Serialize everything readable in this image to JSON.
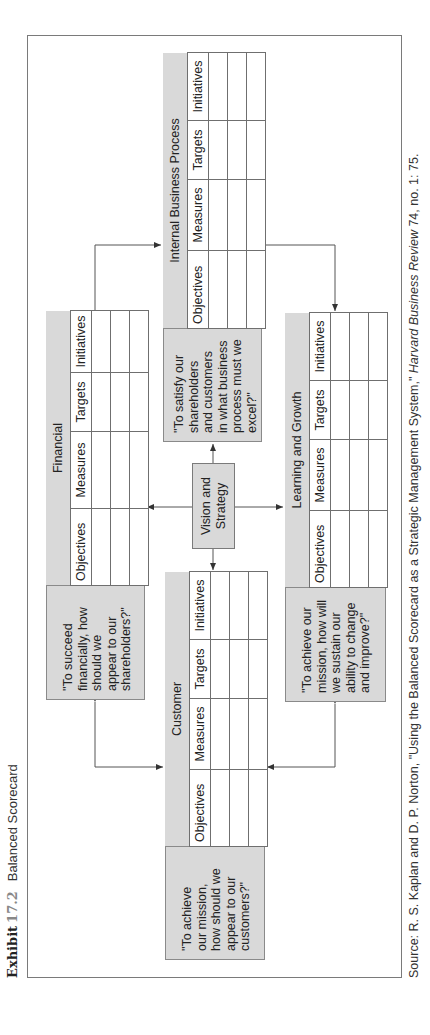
{
  "exhibit": {
    "label": "Exhibit",
    "number": "17.2",
    "title": "Balanced Scorecard"
  },
  "source": {
    "prefix": "Source: R. S. Kaplan and D. P. Norton, \"Using the Balanced Scorecard as a Strategic Management System,\" ",
    "journal": "Harvard Business Review",
    "suffix": " 74, no. 1: 75."
  },
  "center": {
    "label_line1": "Vision and",
    "label_line2": "Strategy"
  },
  "columns": [
    "Objectives",
    "Measures",
    "Targets",
    "Initiatives"
  ],
  "perspectives": {
    "financial": {
      "title": "Financial",
      "quote_lines": [
        "\"To succeed",
        "financially, how",
        "should we",
        "appear to our",
        "shareholders?\""
      ]
    },
    "customer": {
      "title": "Customer",
      "quote_lines": [
        "\"To achieve",
        "our mission,",
        "how should we",
        "appear to our",
        "customers?\""
      ]
    },
    "internal": {
      "title": "Internal Business Process",
      "quote_lines": [
        "\"To satisfy our",
        "shareholders",
        "and customers",
        "in what business",
        "process must we",
        "excel?\""
      ]
    },
    "learning": {
      "title": "Learning and Growth",
      "quote_lines": [
        "\"To achieve our",
        "mission, how will",
        "we sustain our",
        "ability to change",
        "and improve?\""
      ]
    }
  },
  "colors": {
    "block_fill": "#d9d9d9",
    "line": "#6f6f6f",
    "background": "#ffffff"
  }
}
